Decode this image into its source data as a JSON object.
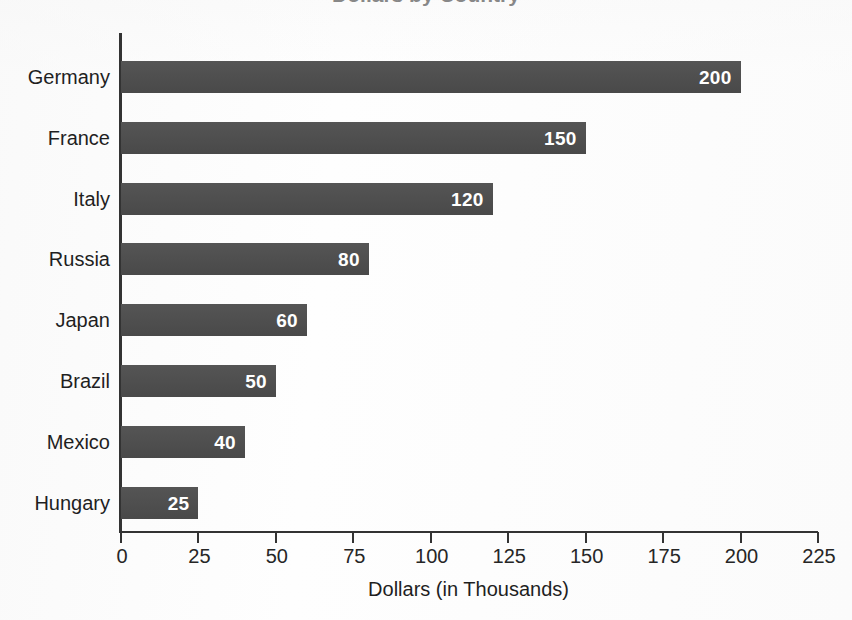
{
  "chart_data": {
    "type": "bar",
    "orientation": "horizontal",
    "title": "Dollars by Country",
    "title_visible": "partially cropped at top edge",
    "categories": [
      "Germany",
      "France",
      "Italy",
      "Russia",
      "Japan",
      "Brazil",
      "Mexico",
      "Hungary"
    ],
    "values": [
      200,
      150,
      120,
      80,
      60,
      50,
      40,
      25
    ],
    "value_labels": [
      "200",
      "150",
      "120",
      "80",
      "60",
      "50",
      "40",
      "25"
    ],
    "xlabel": "Dollars (in Thousands)",
    "ylabel": "",
    "xlim": [
      0,
      225
    ],
    "xticks": [
      0,
      25,
      50,
      75,
      100,
      125,
      150,
      175,
      200,
      225
    ],
    "xtick_labels": [
      "0",
      "25",
      "50",
      "75",
      "100",
      "125",
      "150",
      "175",
      "200",
      "225"
    ],
    "grid": false,
    "legend": null,
    "bar_color": "#4d4d4d",
    "value_label_color": "#ffffff",
    "axis_color": "#333333",
    "background_color": "#fefefe"
  }
}
